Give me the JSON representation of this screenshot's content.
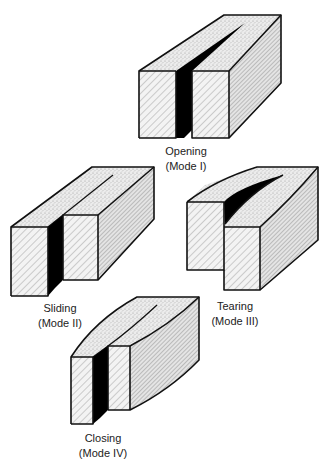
{
  "figure": {
    "modes": [
      {
        "id": "opening",
        "name": "Opening",
        "mode": "(Mode I)"
      },
      {
        "id": "sliding",
        "name": "Sliding",
        "mode": "(Mode II)"
      },
      {
        "id": "tearing",
        "name": "Tearing",
        "mode": "(Mode III)"
      },
      {
        "id": "closing",
        "name": "Closing",
        "mode": "(Mode IV)"
      }
    ]
  },
  "colors": {
    "outline": "#111111",
    "crack": "#000000",
    "top_stipple": "#d8d8d8",
    "hatch": "#9a9a9a",
    "background": "#ffffff"
  }
}
